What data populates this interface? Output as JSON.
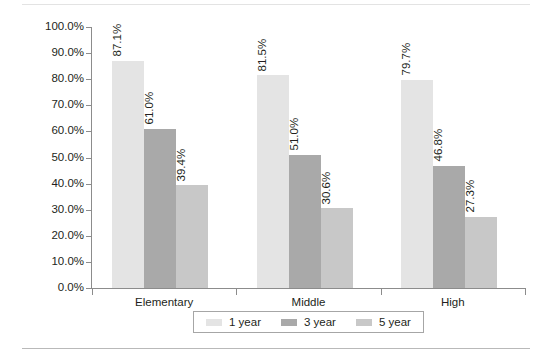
{
  "chart_data": {
    "type": "bar",
    "title": "",
    "subtitle": "",
    "xlabel": "",
    "ylabel": "Retention Percentage",
    "categories": [
      "Elementary",
      "Middle",
      "High"
    ],
    "series": [
      {
        "name": "1 year",
        "color": "#e4e4e4",
        "values": [
          87.1,
          81.5,
          79.7
        ],
        "labels": [
          "87.1%",
          "81.5%",
          "79.7%"
        ]
      },
      {
        "name": "3 year",
        "color": "#a9a9a9",
        "values": [
          61.0,
          51.0,
          46.8
        ],
        "labels": [
          "61.0%",
          "51.0%",
          "46.8%"
        ]
      },
      {
        "name": "5 year",
        "color": "#c8c8c8",
        "values": [
          39.4,
          30.6,
          27.3
        ],
        "labels": [
          "39.4%",
          "30.6%",
          "27.3%"
        ]
      }
    ],
    "ylim": [
      0,
      100
    ],
    "ytick_values": [
      100,
      90,
      80,
      70,
      60,
      50,
      40,
      30,
      20,
      10,
      0
    ],
    "ytick_labels": [
      "100.0%",
      "90.0%",
      "80.0%",
      "70.0%",
      "60.0%",
      "50.0%",
      "40.0%",
      "30.0%",
      "20.0%",
      "10.0%",
      "0.0%"
    ],
    "grid": false,
    "legend_position": "bottom",
    "legend_entries": [
      "1 year",
      "3 year",
      "5 year"
    ]
  },
  "axis": {
    "y_title": "Retention Percentage",
    "y_ticks": [
      "100.0%",
      "90.0%",
      "80.0%",
      "70.0%",
      "60.0%",
      "50.0%",
      "40.0%",
      "30.0%",
      "20.0%",
      "10.0%",
      "0.0%"
    ],
    "x_categories": [
      "Elementary",
      "Middle",
      "High"
    ]
  },
  "legend": {
    "items": [
      {
        "label": "1 year",
        "color": "#e4e4e4"
      },
      {
        "label": "3 year",
        "color": "#a9a9a9"
      },
      {
        "label": "5 year",
        "color": "#c8c8c8"
      }
    ]
  },
  "colors": {
    "series_1_year": "#e4e4e4",
    "series_3_year": "#a9a9a9",
    "series_5_year": "#c8c8c8",
    "axis": "#8c8c8c",
    "text": "#231f20",
    "rule": "#b9b9b9"
  }
}
